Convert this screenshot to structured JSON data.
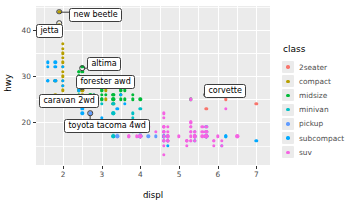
{
  "chart_data": {
    "type": "scatter",
    "title": "",
    "xlabel": "displ",
    "ylabel": "hwy",
    "xlim": [
      1.3,
      7.35
    ],
    "ylim": [
      10.8,
      45.2
    ],
    "xticks": [
      "2",
      "3",
      "4",
      "5",
      "6",
      "7"
    ],
    "xtick_values": [
      2,
      3,
      4,
      5,
      6,
      7
    ],
    "yticks": [
      "20",
      "30",
      "40"
    ],
    "ytick_values": [
      20,
      30,
      40
    ],
    "grid": true,
    "legend_position": "right",
    "legend_title": "class",
    "series": [
      {
        "name": "2seater",
        "color": "#F8766D",
        "points": [
          [
            5.7,
            26
          ],
          [
            5.7,
            23
          ],
          [
            6.2,
            26
          ],
          [
            6.2,
            25
          ],
          [
            7.0,
            24
          ]
        ]
      },
      {
        "name": "compact",
        "color": "#B79F00",
        "points": [
          [
            1.8,
            29
          ],
          [
            1.8,
            29
          ],
          [
            2.0,
            31
          ],
          [
            2.0,
            30
          ],
          [
            2.8,
            26
          ],
          [
            2.8,
            26
          ],
          [
            3.1,
            27
          ],
          [
            1.8,
            26
          ],
          [
            1.8,
            25
          ],
          [
            2.0,
            28
          ],
          [
            2.0,
            27
          ],
          [
            2.8,
            25
          ],
          [
            2.8,
            25
          ],
          [
            3.1,
            25
          ],
          [
            2.4,
            27
          ],
          [
            2.4,
            25
          ],
          [
            2.5,
            27
          ],
          [
            2.5,
            25
          ],
          [
            3.3,
            24
          ],
          [
            2.0,
            33
          ],
          [
            2.0,
            35
          ],
          [
            2.0,
            37
          ],
          [
            2.0,
            36
          ],
          [
            2.0,
            34
          ],
          [
            2.0,
            32
          ],
          [
            1.9,
            44
          ],
          [
            1.9,
            41
          ],
          [
            2.0,
            29
          ],
          [
            2.5,
            27
          ],
          [
            2.5,
            26
          ]
        ]
      },
      {
        "name": "midsize",
        "color": "#00BA38",
        "points": [
          [
            2.4,
            31
          ],
          [
            2.4,
            30
          ],
          [
            3.1,
            26
          ],
          [
            3.5,
            28
          ],
          [
            3.6,
            27
          ],
          [
            2.4,
            29
          ],
          [
            3.0,
            27
          ],
          [
            3.3,
            26
          ],
          [
            3.5,
            25
          ],
          [
            3.8,
            25
          ],
          [
            3.8,
            26
          ],
          [
            4.0,
            25
          ],
          [
            2.5,
            32
          ],
          [
            2.5,
            31
          ],
          [
            2.4,
            29
          ],
          [
            2.4,
            29
          ],
          [
            3.5,
            29
          ],
          [
            3.5,
            29
          ],
          [
            3.5,
            28
          ],
          [
            3.5,
            27
          ],
          [
            3.0,
            26
          ],
          [
            3.3,
            25
          ],
          [
            3.5,
            26
          ],
          [
            5.3,
            25
          ],
          [
            2.7,
            26
          ],
          [
            2.7,
            26
          ],
          [
            3.0,
            25
          ],
          [
            3.5,
            26
          ],
          [
            2.4,
            27
          ],
          [
            2.4,
            26
          ],
          [
            3.0,
            25
          ],
          [
            3.3,
            25
          ],
          [
            2.4,
            31
          ],
          [
            3.0,
            27
          ],
          [
            2.4,
            30
          ],
          [
            3.3,
            26
          ],
          [
            3.5,
            27
          ],
          [
            3.6,
            25
          ]
        ]
      },
      {
        "name": "minivan",
        "color": "#00BFC4",
        "points": [
          [
            2.4,
            24
          ],
          [
            3.0,
            24
          ],
          [
            3.3,
            22
          ],
          [
            3.3,
            22
          ],
          [
            3.3,
            24
          ],
          [
            3.3,
            24
          ],
          [
            3.3,
            17
          ],
          [
            3.8,
            22
          ],
          [
            3.8,
            21
          ],
          [
            4.0,
            23
          ],
          [
            3.3,
            18
          ],
          [
            3.8,
            18
          ],
          [
            3.3,
            17
          ]
        ]
      },
      {
        "name": "pickup",
        "color": "#619CFF",
        "points": [
          [
            2.7,
            20
          ],
          [
            2.7,
            20
          ],
          [
            3.4,
            17
          ],
          [
            3.4,
            17
          ],
          [
            4.0,
            17
          ],
          [
            4.7,
            17
          ],
          [
            4.7,
            16
          ],
          [
            5.7,
            17
          ],
          [
            5.7,
            17
          ],
          [
            4.0,
            18
          ],
          [
            4.0,
            18
          ],
          [
            4.6,
            17
          ],
          [
            5.4,
            16
          ],
          [
            5.4,
            17
          ],
          [
            4.0,
            19
          ],
          [
            4.0,
            18
          ],
          [
            4.6,
            17
          ],
          [
            4.6,
            16
          ],
          [
            4.6,
            16
          ],
          [
            5.4,
            16
          ],
          [
            2.7,
            22
          ],
          [
            3.4,
            19
          ],
          [
            3.4,
            18
          ],
          [
            4.0,
            18
          ],
          [
            4.0,
            17
          ],
          [
            4.7,
            16
          ],
          [
            4.7,
            16
          ],
          [
            4.7,
            17
          ],
          [
            5.7,
            17
          ],
          [
            5.7,
            17
          ],
          [
            6.1,
            15
          ],
          [
            4.0,
            19
          ],
          [
            4.2,
            17
          ],
          [
            4.4,
            17
          ],
          [
            4.6,
            17
          ],
          [
            5.4,
            18
          ],
          [
            5.4,
            17
          ]
        ]
      },
      {
        "name": "subcompact",
        "color": "#00A9FF",
        "points": [
          [
            1.6,
            33
          ],
          [
            1.6,
            32
          ],
          [
            1.6,
            29
          ],
          [
            1.6,
            29
          ],
          [
            1.6,
            29
          ],
          [
            1.8,
            29
          ],
          [
            1.8,
            29
          ],
          [
            2.0,
            28
          ],
          [
            2.4,
            27
          ],
          [
            2.4,
            24
          ],
          [
            2.5,
            25
          ],
          [
            2.5,
            24
          ],
          [
            3.4,
            23
          ],
          [
            3.8,
            20
          ],
          [
            4.7,
            15
          ],
          [
            5.7,
            19
          ],
          [
            5.7,
            18
          ],
          [
            5.7,
            17
          ],
          [
            6.2,
            17
          ],
          [
            6.2,
            17
          ],
          [
            7.0,
            16
          ],
          [
            2.5,
            23
          ],
          [
            2.5,
            22
          ],
          [
            3.0,
            21
          ],
          [
            3.5,
            26
          ],
          [
            4.0,
            17
          ],
          [
            4.0,
            17
          ],
          [
            4.6,
            18
          ],
          [
            4.6,
            17
          ],
          [
            5.4,
            17
          ],
          [
            1.8,
            33
          ],
          [
            1.8,
            32
          ],
          [
            2.0,
            32
          ],
          [
            2.0,
            29
          ],
          [
            2.8,
            26
          ],
          [
            2.8,
            25
          ],
          [
            3.6,
            24
          ]
        ]
      },
      {
        "name": "suv",
        "color": "#F564E3",
        "points": [
          [
            4.6,
            19
          ],
          [
            5.4,
            17
          ],
          [
            5.4,
            17
          ],
          [
            4.0,
            19
          ],
          [
            4.0,
            19
          ],
          [
            4.6,
            19
          ],
          [
            5.0,
            17
          ],
          [
            4.2,
            19
          ],
          [
            4.4,
            18
          ],
          [
            4.6,
            18
          ],
          [
            5.4,
            18
          ],
          [
            5.4,
            17
          ],
          [
            4.0,
            17
          ],
          [
            4.0,
            17
          ],
          [
            4.6,
            16
          ],
          [
            5.4,
            16
          ],
          [
            3.9,
            17
          ],
          [
            4.7,
            16
          ],
          [
            4.7,
            16
          ],
          [
            5.2,
            15
          ],
          [
            5.7,
            17
          ],
          [
            5.9,
            15
          ],
          [
            4.7,
            17
          ],
          [
            4.7,
            17
          ],
          [
            5.2,
            16
          ],
          [
            5.7,
            17
          ],
          [
            5.9,
            16
          ],
          [
            6.5,
            17
          ],
          [
            3.7,
            17
          ],
          [
            3.7,
            17
          ],
          [
            4.0,
            17
          ],
          [
            4.7,
            17
          ],
          [
            5.7,
            17
          ],
          [
            6.1,
            15
          ],
          [
            4.6,
            15
          ],
          [
            4.6,
            13
          ],
          [
            5.2,
            16
          ],
          [
            5.2,
            16
          ],
          [
            5.7,
            19
          ],
          [
            5.7,
            18
          ],
          [
            5.7,
            18
          ],
          [
            6.1,
            16
          ],
          [
            4.7,
            16
          ],
          [
            4.7,
            16
          ],
          [
            4.7,
            16
          ],
          [
            5.3,
            19
          ],
          [
            5.3,
            19
          ],
          [
            5.3,
            20
          ],
          [
            5.3,
            20
          ],
          [
            5.3,
            18
          ],
          [
            5.3,
            17
          ],
          [
            5.3,
            16
          ],
          [
            5.3,
            16
          ],
          [
            5.3,
            18
          ],
          [
            4.6,
            18
          ],
          [
            4.6,
            19
          ],
          [
            4.6,
            19
          ],
          [
            5.4,
            18
          ],
          [
            5.6,
            19
          ],
          [
            5.6,
            18
          ],
          [
            5.6,
            17
          ],
          [
            5.9,
            16
          ],
          [
            6.0,
            17
          ],
          [
            6.5,
            17
          ],
          [
            4.7,
            19
          ],
          [
            4.7,
            18
          ],
          [
            5.7,
            18
          ],
          [
            5.7,
            17
          ],
          [
            5.2,
            16
          ],
          [
            5.2,
            16
          ],
          [
            4.6,
            22
          ],
          [
            4.6,
            21
          ],
          [
            4.6,
            19
          ],
          [
            4.6,
            18
          ],
          [
            4.6,
            18
          ],
          [
            4.6,
            17
          ],
          [
            4.6,
            16
          ],
          [
            4.6,
            16
          ],
          [
            5.3,
            25
          ],
          [
            6.2,
            23
          ],
          [
            5.4,
            17
          ],
          [
            5.4,
            17
          ],
          [
            5.4,
            17
          ]
        ]
      }
    ],
    "labels": [
      {
        "text": "new beetle",
        "point": [
          1.9,
          44.0
        ],
        "box_x": 69,
        "box_y": 8
      },
      {
        "text": "jetta",
        "point": [
          1.9,
          41.5
        ],
        "box_x": 36,
        "box_y": 24
      },
      {
        "text": "altima",
        "point": [
          2.5,
          31.8
        ],
        "box_x": 87,
        "box_y": 57
      },
      {
        "text": "forester awd",
        "point": [
          2.5,
          27.6
        ],
        "box_x": 76,
        "box_y": 75
      },
      {
        "text": "caravan 2wd",
        "point": [
          2.4,
          24.0
        ],
        "box_x": 39,
        "box_y": 94
      },
      {
        "text": "toyota tacoma 4wd",
        "point": [
          2.7,
          22.0
        ],
        "box_x": 64,
        "box_y": 119
      },
      {
        "text": "corvette",
        "point": [
          5.7,
          26.0
        ],
        "box_x": 204,
        "box_y": 84
      }
    ]
  }
}
